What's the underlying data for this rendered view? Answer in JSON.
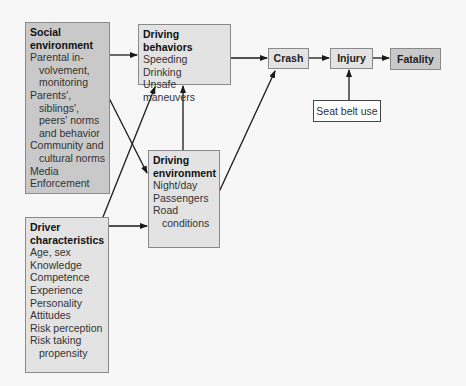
{
  "nodes": {
    "social": {
      "title": "Social environment",
      "items": [
        "Parental in-",
        "volvement,",
        "monitoring",
        "Parents',",
        "siblings',",
        "peers' norms",
        "and behavior",
        "Community and",
        "cultural norms",
        "Media",
        "Enforcement"
      ]
    },
    "behaviors": {
      "title": "Driving behaviors",
      "items": [
        "Speeding",
        "Drinking",
        "Unsafe maneuvers"
      ]
    },
    "environment": {
      "title_1": "Driving",
      "title_2": "environment",
      "items": [
        "Night/day",
        "Passengers",
        "Road",
        "conditions"
      ]
    },
    "driver": {
      "title_1": "Driver",
      "title_2": "characteristics",
      "items": [
        "Age, sex",
        "Knowledge",
        "Competence",
        "Experience",
        "Personality",
        "Attitudes",
        "Risk perception",
        "Risk taking",
        "propensity"
      ]
    },
    "crash": {
      "label": "Crash"
    },
    "injury": {
      "label": "Injury"
    },
    "fatality": {
      "label": "Fatality"
    },
    "seatbelt": {
      "label": "Seat belt use"
    }
  },
  "edges": [
    [
      "Social environment",
      "Driving behaviors"
    ],
    [
      "Social environment",
      "Driving environment"
    ],
    [
      "Driver characteristics",
      "Driving behaviors"
    ],
    [
      "Driver characteristics",
      "Driving environment"
    ],
    [
      "Driving environment",
      "Driving behaviors"
    ],
    [
      "Driving environment",
      "Crash"
    ],
    [
      "Driving behaviors",
      "Crash"
    ],
    [
      "Crash",
      "Injury"
    ],
    [
      "Injury",
      "Fatality"
    ],
    [
      "Seat belt use",
      "Injury"
    ]
  ],
  "colors": {
    "light_box": "#e3e3e3",
    "dark_box": "#c9c9c9",
    "border": "#8a8a8a",
    "arrow": "#1a1a1a"
  }
}
